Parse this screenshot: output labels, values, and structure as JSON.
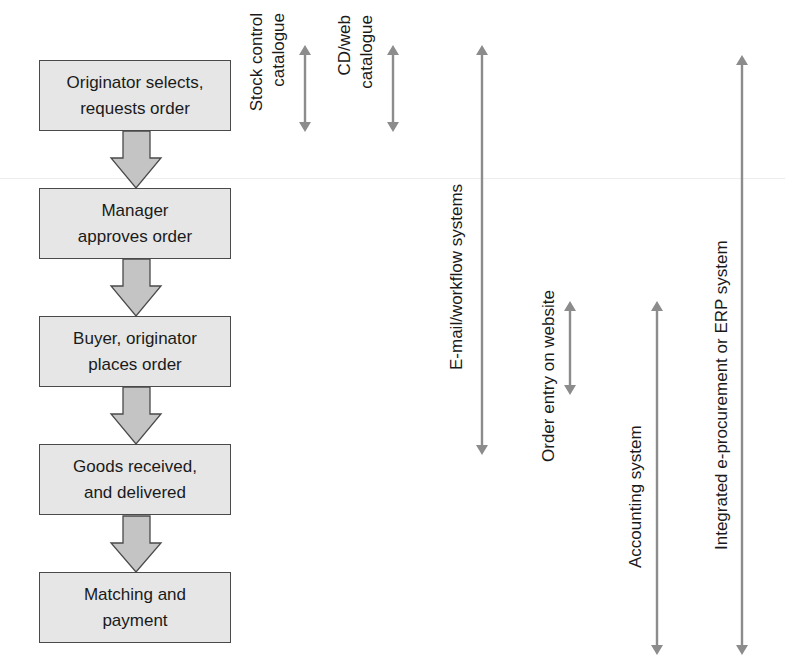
{
  "diagram": {
    "type": "procurement-process-flow",
    "colors": {
      "box_fill": "#e6e6e6",
      "box_border": "#4a4a4a",
      "block_arrow_fill": "#c4c4c4",
      "system_arrow": "#8c8c8c",
      "text": "#1a1a1a"
    },
    "steps": [
      {
        "label": "Originator selects,\nrequests order"
      },
      {
        "label": "Manager\napproves order"
      },
      {
        "label": "Buyer, originator\nplaces order"
      },
      {
        "label": "Goods received,\nand delivered"
      },
      {
        "label": "Matching and\npayment"
      }
    ],
    "systems": [
      {
        "label": "Stock control\ncatalogue",
        "spans_steps": [
          1
        ]
      },
      {
        "label": "CD/web\ncatalogue",
        "spans_steps": [
          1
        ]
      },
      {
        "label": "E-mail/workflow systems",
        "spans_steps": [
          1,
          2,
          3,
          4
        ]
      },
      {
        "label": "Order entry on website",
        "spans_steps": [
          3
        ]
      },
      {
        "label": "Accounting system",
        "spans_steps": [
          3,
          4,
          5
        ]
      },
      {
        "label": "Integrated e-procurement or ERP system",
        "spans_steps": [
          1,
          2,
          3,
          4,
          5
        ]
      }
    ]
  }
}
